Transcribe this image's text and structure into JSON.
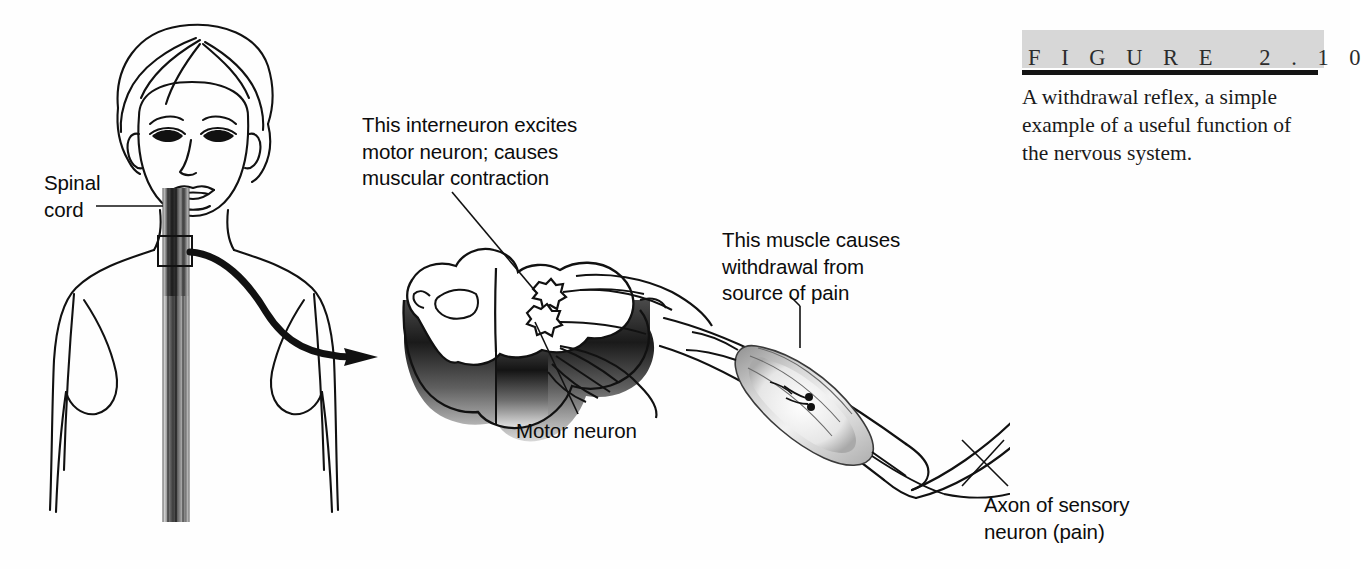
{
  "figure": {
    "banner_label": "F I G U R E   2 . 1 0",
    "caption": "A withdrawal reflex, a simple example of a useful function of the nervous system.",
    "banner_background": "#d7d7d7",
    "rule_color": "#141414"
  },
  "labels": {
    "spinal_cord": "Spinal\ncord",
    "interneuron": "This interneuron excites\nmotor neuron;  causes\nmuscular contraction",
    "motor_neuron": "Motor neuron",
    "muscle": "This muscle causes\nwithdrawal from\nsource of pain",
    "axon": "Axon of sensory\nneuron (pain)"
  },
  "illustration": {
    "title": "Withdrawal reflex diagram",
    "parts": [
      "female-head-torso",
      "spinal-cord-column",
      "magnification-box",
      "magnification-arrow",
      "spinal-cord-cross-section",
      "interneuron-cell-body",
      "motor-neuron-cell-body",
      "nerve-roots",
      "arm",
      "biceps-muscle",
      "hand"
    ],
    "line_color": "#111111",
    "ink_color": "#2b2b2b",
    "background": "#ffffff"
  }
}
